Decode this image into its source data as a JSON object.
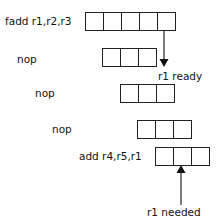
{
  "diagram": {
    "rows": [
      {
        "instruction": "fadd r1,r2,r3",
        "stages": 5
      },
      {
        "instruction": "nop",
        "stages": 3
      },
      {
        "instruction": "nop",
        "stages": 3
      },
      {
        "instruction": "nop",
        "stages": 3
      },
      {
        "instruction": "add r4,r5,r1",
        "stages": 3
      }
    ],
    "annotations": {
      "ready": "r1 ready",
      "needed": "r1 needed"
    },
    "colors": {
      "line": "#222222",
      "background": "#ffffff"
    }
  }
}
